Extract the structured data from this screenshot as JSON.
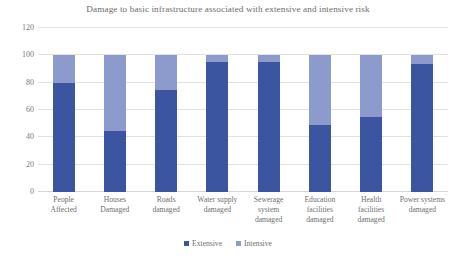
{
  "chart_data": {
    "type": "bar",
    "title": "Damage to basic infrastructure associated with extensive and intensive risk",
    "xlabel": "",
    "ylabel": "",
    "ylim": [
      0,
      120
    ],
    "yticks": [
      0,
      20,
      40,
      60,
      80,
      100,
      120
    ],
    "grid": true,
    "stacked": true,
    "legend_position": "bottom",
    "categories": [
      "People Affected",
      "Houses Damaged",
      "Roads damaged",
      "Water supply damaged",
      "Sewerage system damaged",
      "Education facilities damaged",
      "Health facilities damaged",
      "Power systems damaged"
    ],
    "series": [
      {
        "name": "Extensive",
        "color": "#3B55A0",
        "values": [
          80,
          45,
          75,
          95,
          95,
          49,
          55,
          94
        ]
      },
      {
        "name": "Intensive",
        "color": "#8C9BCB",
        "values": [
          20,
          55,
          25,
          5,
          5,
          51,
          45,
          6
        ]
      }
    ]
  },
  "axis": {
    "ytick_labels": [
      "120",
      "100",
      "80",
      "60",
      "40",
      "20",
      "0"
    ]
  },
  "legend": {
    "items": [
      {
        "label": "Extensive",
        "color": "#3B55A0"
      },
      {
        "label": "Intensive",
        "color": "#8C9BCB"
      }
    ]
  },
  "colors": {
    "extensive": "#3B55A0",
    "intensive": "#8C9BCB",
    "gridline": "#e2e2e2",
    "text": "#6f6f6f",
    "title": "#6d6d6d",
    "background": "#ffffff"
  }
}
